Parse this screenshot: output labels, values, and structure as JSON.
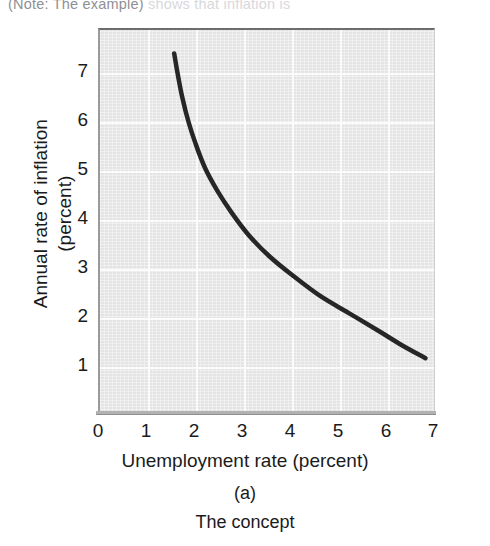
{
  "scan": {
    "top_cropped_line": "(Note: The example)",
    "top_cropped_line_tail": " shows that inflation is"
  },
  "figure": {
    "panel_letter": "(a)",
    "caption": "The concept"
  },
  "chart_data": {
    "type": "line",
    "title": "",
    "subtitle": "",
    "xlabel": "Unemployment rate (percent)",
    "ylabel": "Annual rate of inflation (percent)",
    "ylabel_line1": "Annual rate of inflation",
    "ylabel_line2": "(percent)",
    "xlim": [
      0,
      7
    ],
    "ylim": [
      0,
      7.6
    ],
    "xticks": [
      0,
      1,
      2,
      3,
      4,
      5,
      6,
      7
    ],
    "xtick_labels": [
      "0",
      "1",
      "2",
      "3",
      "4",
      "5",
      "6",
      "7"
    ],
    "yticks": [
      1,
      2,
      3,
      4,
      5,
      6,
      7
    ],
    "ytick_labels": [
      "1",
      "2",
      "3",
      "4",
      "5",
      "6",
      "7"
    ],
    "grid": true,
    "grid_color": "#fbfbfb",
    "plot_background": "#e4e4e4",
    "legend": null,
    "legend_position": "none",
    "series": [
      {
        "name": "Phillips curve",
        "color": "#262626",
        "line_width": 4.5,
        "x": [
          1.55,
          1.62,
          1.72,
          1.85,
          2.0,
          2.2,
          2.45,
          2.75,
          3.1,
          3.55,
          4.05,
          4.6,
          5.2,
          5.8,
          6.3,
          6.8
        ],
        "y": [
          7.4,
          7.0,
          6.5,
          6.0,
          5.55,
          5.05,
          4.6,
          4.15,
          3.7,
          3.25,
          2.85,
          2.45,
          2.1,
          1.75,
          1.45,
          1.18
        ]
      }
    ],
    "annotations": []
  }
}
